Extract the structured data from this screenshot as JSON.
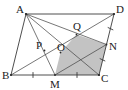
{
  "figure": {
    "type": "geometry-diagram",
    "background_color": "#ffffff",
    "line_color": "#3a3a3a",
    "shade_color": "#b8b8b8",
    "label_color": "#1a1a1a"
  },
  "labels": {
    "A": "A",
    "B": "B",
    "C": "C",
    "D": "D",
    "M": "M",
    "N": "N",
    "O": "O",
    "P": "P",
    "Q": "Q"
  },
  "points": {
    "A": {
      "x": 26,
      "y": 14,
      "label": "A",
      "label_x": 16,
      "label_y": 13
    },
    "B": {
      "x": 11,
      "y": 75,
      "label": "B",
      "label_x": 2,
      "label_y": 79
    },
    "C": {
      "x": 99,
      "y": 75,
      "label": "C",
      "label_x": 101,
      "label_y": 82
    },
    "D": {
      "x": 114,
      "y": 14,
      "label": "D",
      "label_x": 116,
      "label_y": 13
    },
    "M": {
      "x": 55,
      "y": 75,
      "label": "M",
      "label_x": 50,
      "label_y": 88
    },
    "N": {
      "x": 106.5,
      "y": 44.5,
      "label": "N",
      "label_x": 109,
      "label_y": 50
    },
    "O": {
      "x": 60.5,
      "y": 52.5,
      "label": "O",
      "label_x": 57,
      "label_y": 51
    },
    "P": {
      "x": 44.5,
      "y": 50.5,
      "label": "P",
      "label_x": 37,
      "label_y": 48
    },
    "Q": {
      "x": 76.5,
      "y": 34.5,
      "label": "Q",
      "label_x": 74,
      "label_y": 30
    }
  },
  "segments": [
    {
      "name": "AB",
      "from": "A",
      "to": "B",
      "kind": "edge"
    },
    {
      "name": "BC",
      "from": "B",
      "to": "C",
      "kind": "edge"
    },
    {
      "name": "CD",
      "from": "C",
      "to": "D",
      "kind": "edge"
    },
    {
      "name": "DA",
      "from": "D",
      "to": "A",
      "kind": "edge"
    },
    {
      "name": "AC",
      "from": "A",
      "to": "C",
      "kind": "cevian"
    },
    {
      "name": "BD",
      "from": "B",
      "to": "D",
      "kind": "cevian"
    },
    {
      "name": "AM",
      "from": "A",
      "to": "M",
      "kind": "cevian"
    },
    {
      "name": "AN",
      "from": "A",
      "to": "N",
      "kind": "cevian"
    },
    {
      "name": "MN",
      "from": "M",
      "to": "N",
      "kind": "cevian"
    }
  ],
  "shaded_region": {
    "name": "region-MCNQO",
    "vertices": [
      "M",
      "C",
      "N",
      "Q",
      "O"
    ],
    "color": "#b8b8b8"
  },
  "tick_marks": [
    {
      "name": "tick-BM",
      "on": "BM",
      "count": 1
    },
    {
      "name": "tick-MC",
      "on": "MC",
      "count": 1
    },
    {
      "name": "tick-DN",
      "on": "DN",
      "count": 1
    },
    {
      "name": "tick-NC",
      "on": "NC",
      "count": 1
    }
  ]
}
